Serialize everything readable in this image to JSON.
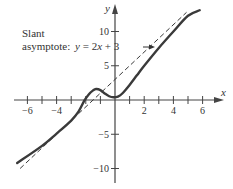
{
  "chart_data": {
    "type": "line",
    "title": "",
    "xlabel": "x",
    "ylabel": "y",
    "xlim": [
      -6.5,
      6.5
    ],
    "ylim": [
      -11.5,
      13.5
    ],
    "x_ticks": [
      -6,
      -5,
      -4,
      -3,
      -2,
      -1,
      1,
      2,
      3,
      4,
      5,
      6
    ],
    "x_tick_labels": [
      {
        "value": -6,
        "label": "−6"
      },
      {
        "value": -4,
        "label": "−4"
      },
      {
        "value": 2,
        "label": "2"
      },
      {
        "value": 4,
        "label": "4"
      },
      {
        "value": 6,
        "label": "6"
      }
    ],
    "y_ticks": [
      10,
      5,
      -5,
      -10
    ],
    "y_tick_labels": [
      {
        "value": 10,
        "label": "10"
      },
      {
        "value": 5,
        "label": "5"
      },
      {
        "value": -5,
        "label": "−5"
      },
      {
        "value": -10,
        "label": "−10"
      }
    ],
    "grid": false,
    "series": [
      {
        "name": "f(x)",
        "style": "solid",
        "x": [
          -6.7,
          -5,
          -4,
          -3,
          -2.5,
          -2.1,
          -1.8,
          -1.5,
          -1.3,
          -1.0,
          -0.7,
          -0.4,
          -0.1,
          0.2,
          0.5,
          1.0,
          1.5,
          2,
          3,
          4,
          5,
          5.8
        ],
        "y": [
          -9.2,
          -6.7,
          -4.9,
          -3.0,
          -1.7,
          -0.1,
          0.8,
          1.4,
          1.6,
          1.45,
          0.95,
          0.55,
          0.4,
          0.5,
          0.95,
          2.2,
          3.6,
          5.0,
          7.6,
          10.0,
          12.3,
          13.1
        ]
      },
      {
        "name": "Slant asymptote y = 2x + 3",
        "style": "dashed",
        "x": [
          -6.5,
          4.9
        ],
        "y": [
          -10.0,
          12.8
        ]
      }
    ],
    "annotations": [
      {
        "text": "Slant",
        "line": 1
      },
      {
        "text": "asymptote:",
        "line": 2,
        "equation": "y = 2x + 3",
        "arrow_to": "asymptote"
      }
    ]
  },
  "labels": {
    "x_axis": "x",
    "y_axis": "y",
    "annot_line1": "Slant",
    "annot_line2": "asymptote:",
    "annot_eq_y": "y",
    "annot_eq_mid": " = 2",
    "annot_eq_x": "x",
    "annot_eq_end": " + 3"
  },
  "colors": {
    "curve": "#3a3a3a",
    "asymptote": "#3a3a3a",
    "axes": "#444444",
    "text": "#333333"
  }
}
